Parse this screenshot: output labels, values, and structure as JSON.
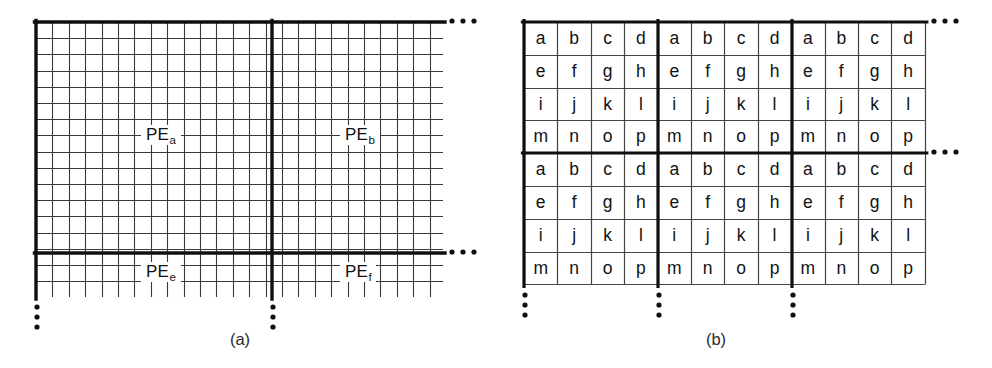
{
  "figure": {
    "background_color": "#ffffff",
    "ink_color": "#111111"
  },
  "panel_a": {
    "caption": "(a)",
    "caption_x": 240,
    "caption_y": 330,
    "description": "Fine mesh grid partitioned by heavy rules into PE regions",
    "geometry": {
      "grid_left": 36,
      "grid_top": 22,
      "grid_right": 443,
      "grid_bottom": 297,
      "cell_w": 16.4,
      "cell_h": 16.2,
      "cols_total": 25,
      "rows_total": 17,
      "divider_x": 272,
      "divider_y": 253
    },
    "pe_labels": [
      {
        "name": "PE",
        "sub": "a",
        "x": 141,
        "y": 125
      },
      {
        "name": "PE",
        "sub": "b",
        "x": 340,
        "y": 125
      },
      {
        "name": "PE",
        "sub": "e",
        "x": 141,
        "y": 262
      },
      {
        "name": "PE",
        "sub": "f",
        "x": 340,
        "y": 262
      }
    ],
    "ellipsis_horizontal": [
      {
        "x": 452,
        "y": 21
      },
      {
        "x": 452,
        "y": 252
      }
    ],
    "ellipsis_vertical": [
      {
        "x": 37,
        "y": 307
      },
      {
        "x": 273,
        "y": 307
      }
    ]
  },
  "panel_b": {
    "caption": "(b)",
    "caption_x": 716,
    "caption_y": 330,
    "description": "Block-cyclic letter assignment: each 4x4 tile repeats letters a through p",
    "geometry": {
      "grid_left": 524,
      "grid_top": 22,
      "cell_w": 33.4,
      "cell_h": 32.8,
      "block_cols": 3,
      "block_rows": 2,
      "tile_cols": 4,
      "tile_rows": 4,
      "divider_x": [
        658,
        792
      ],
      "divider_y": [
        153
      ],
      "grid_right": 925,
      "grid_bottom": 285
    },
    "tile_letters": [
      [
        "a",
        "b",
        "c",
        "d"
      ],
      [
        "e",
        "f",
        "g",
        "h"
      ],
      [
        "i",
        "j",
        "k",
        "l"
      ],
      [
        "m",
        "n",
        "o",
        "p"
      ]
    ],
    "ellipsis_horizontal": [
      {
        "x": 934,
        "y": 21
      },
      {
        "x": 934,
        "y": 152
      }
    ],
    "ellipsis_vertical": [
      {
        "x": 525,
        "y": 295
      },
      {
        "x": 659,
        "y": 295
      },
      {
        "x": 793,
        "y": 295
      }
    ]
  }
}
